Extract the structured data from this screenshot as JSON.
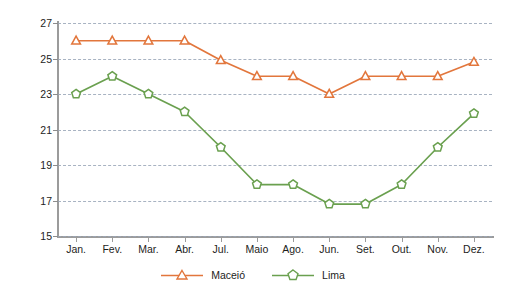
{
  "chart_data": {
    "type": "line",
    "title": "",
    "xlabel": "",
    "ylabel": "Temperatura (°C)",
    "ylim": [
      15,
      27
    ],
    "yticks": [
      15,
      17,
      19,
      21,
      23,
      25,
      27
    ],
    "grid": true,
    "legend_position": "bottom",
    "categories": [
      "Jan.",
      "Fev.",
      "Mar.",
      "Abr.",
      "Jul.",
      "Maio",
      "Ago.",
      "Jun.",
      "Set.",
      "Out.",
      "Nov.",
      "Dez."
    ],
    "series": [
      {
        "name": "Maceió",
        "color": "#E2763C",
        "marker": "triangle",
        "values": [
          26,
          26,
          26,
          26,
          24.9,
          24,
          24,
          23,
          24,
          24,
          24,
          24.8
        ]
      },
      {
        "name": "Lima",
        "color": "#6AA04F",
        "marker": "pentagon",
        "values": [
          23,
          24,
          23,
          22,
          20,
          17.9,
          17.9,
          16.8,
          16.8,
          17.9,
          20,
          21.9
        ]
      }
    ]
  },
  "legend": {
    "items": [
      {
        "label": "Maceió"
      },
      {
        "label": "Lima"
      }
    ]
  },
  "colors": {
    "maceio": "#E2763C",
    "lima": "#6AA04F",
    "axis": "#9b9b9b",
    "grid": "#9aa6b8",
    "text": "#1d1d1b",
    "background": "#ffffff"
  }
}
